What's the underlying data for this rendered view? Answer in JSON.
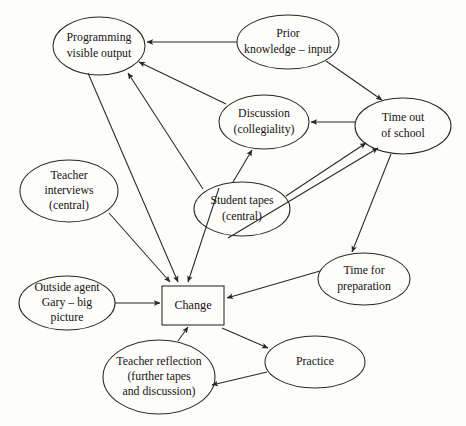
{
  "diagram": {
    "type": "node-link-diagram",
    "canvas": {
      "width": 466,
      "height": 426,
      "background": "#fdfdfb"
    },
    "style": {
      "stroke": "#2b2724",
      "text": "#17120f",
      "font_size": 11.5
    },
    "nodes": [
      {
        "id": "programming",
        "shape": "ellipse",
        "cx": 99,
        "cy": 46,
        "rx": 46,
        "ry": 29,
        "font_size": 11.8,
        "lines": [
          "Programming",
          "visible output"
        ]
      },
      {
        "id": "prior-knowledge",
        "shape": "ellipse",
        "cx": 288,
        "cy": 42,
        "rx": 51,
        "ry": 27,
        "font_size": 11.8,
        "lines": [
          "Prior",
          "knowledge – input"
        ]
      },
      {
        "id": "discussion",
        "shape": "ellipse",
        "cx": 264,
        "cy": 122,
        "rx": 45,
        "ry": 27,
        "font_size": 11.8,
        "lines": [
          "Discussion",
          "(collegiality)"
        ]
      },
      {
        "id": "time-out-of-school",
        "shape": "ellipse",
        "cx": 403,
        "cy": 126,
        "rx": 48,
        "ry": 28,
        "font_size": 11.8,
        "lines": [
          "Time out",
          "of school"
        ]
      },
      {
        "id": "teacher-interviews",
        "shape": "ellipse",
        "cx": 69,
        "cy": 191,
        "rx": 49,
        "ry": 31,
        "font_size": 11.8,
        "lines": [
          "Teacher",
          "interviews",
          "(central)"
        ]
      },
      {
        "id": "student-tapes",
        "shape": "ellipse",
        "cx": 242,
        "cy": 209,
        "rx": 48,
        "ry": 27,
        "font_size": 11.8,
        "lines": [
          "Student tapes",
          "(central)"
        ]
      },
      {
        "id": "time-for-preparation",
        "shape": "ellipse",
        "cx": 364,
        "cy": 279,
        "rx": 46,
        "ry": 26,
        "font_size": 11.8,
        "lines": [
          "Time for",
          "preparation"
        ]
      },
      {
        "id": "outside-agent",
        "shape": "ellipse",
        "cx": 67,
        "cy": 303,
        "rx": 48,
        "ry": 27,
        "font_size": 11.8,
        "lines": [
          "Outside agent",
          "Gary – big",
          "picture"
        ]
      },
      {
        "id": "change",
        "shape": "rect",
        "x": 162,
        "y": 286,
        "width": 62,
        "height": 39,
        "font_size": 12.2,
        "lines": [
          "Change"
        ]
      },
      {
        "id": "practice",
        "shape": "ellipse",
        "cx": 315,
        "cy": 362,
        "rx": 50,
        "ry": 26,
        "font_size": 11.8,
        "lines": [
          "Practice"
        ]
      },
      {
        "id": "teacher-reflection",
        "shape": "ellipse",
        "cx": 159,
        "cy": 377,
        "rx": 56,
        "ry": 37,
        "font_size": 11.8,
        "lines": [
          "Teacher reflection",
          "(further tapes",
          "and discussion)"
        ]
      }
    ],
    "edges": [
      {
        "id": "prior-to-programming",
        "from": "prior-knowledge",
        "to": "programming",
        "x1": 237,
        "y1": 42,
        "x2": 147,
        "y2": 42
      },
      {
        "id": "prior-to-time-out",
        "from": "prior-knowledge",
        "to": "time-out-of-school",
        "x1": 326,
        "y1": 61,
        "x2": 382,
        "y2": 100
      },
      {
        "id": "time-out-to-discussion",
        "from": "time-out-of-school",
        "to": "discussion",
        "x1": 355,
        "y1": 122,
        "x2": 311,
        "y2": 122
      },
      {
        "id": "discussion-to-programming",
        "from": "discussion",
        "to": "programming",
        "x1": 226,
        "y1": 104,
        "x2": 139,
        "y2": 62
      },
      {
        "id": "student-tapes-to-programming",
        "from": "student-tapes",
        "to": "programming",
        "x1": 203,
        "y1": 189,
        "x2": 128,
        "y2": 73
      },
      {
        "id": "student-tapes-to-discussion",
        "from": "student-tapes",
        "to": "discussion",
        "x1": 233,
        "y1": 182,
        "x2": 252,
        "y2": 150
      },
      {
        "id": "student-tapes-to-time-out",
        "from": "student-tapes",
        "to": "time-out-of-school",
        "x1": 286,
        "y1": 196,
        "x2": 366,
        "y2": 143
      },
      {
        "id": "change-to-time-out",
        "from": "change",
        "to": "time-out-of-school",
        "x1": 228,
        "y1": 238,
        "x2": 378,
        "y2": 148
      },
      {
        "id": "teacher-interviews-to-change",
        "from": "teacher-interviews",
        "to": "change",
        "x1": 109,
        "y1": 213,
        "x2": 170,
        "y2": 282
      },
      {
        "id": "programming-to-change",
        "from": "programming",
        "to": "change",
        "x1": 88,
        "y1": 73,
        "x2": 178,
        "y2": 282
      },
      {
        "id": "student-tapes-to-change",
        "from": "student-tapes",
        "to": "change",
        "x1": 219,
        "y1": 188,
        "x2": 188,
        "y2": 282
      },
      {
        "id": "outside-agent-to-change",
        "from": "outside-agent",
        "to": "change",
        "x1": 115,
        "y1": 303,
        "x2": 160,
        "y2": 303
      },
      {
        "id": "time-for-preparation-to-change",
        "from": "time-for-preparation",
        "to": "change",
        "x1": 320,
        "y1": 271,
        "x2": 227,
        "y2": 298
      },
      {
        "id": "time-out-to-time-for-preparation",
        "from": "time-out-of-school",
        "to": "time-for-preparation",
        "x1": 391,
        "y1": 154,
        "x2": 352,
        "y2": 252
      },
      {
        "id": "change-to-practice",
        "from": "change",
        "to": "practice",
        "x1": 222,
        "y1": 328,
        "x2": 268,
        "y2": 348
      },
      {
        "id": "practice-to-teacher-reflection",
        "from": "practice",
        "to": "teacher-reflection",
        "x1": 267,
        "y1": 372,
        "x2": 212,
        "y2": 385
      },
      {
        "id": "teacher-reflection-to-change",
        "from": "teacher-reflection",
        "to": "change",
        "x1": 178,
        "y1": 341,
        "x2": 188,
        "y2": 327
      }
    ]
  }
}
